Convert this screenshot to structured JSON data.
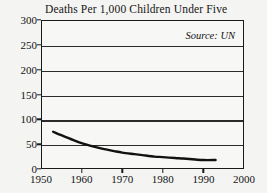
{
  "chart_data": {
    "type": "line",
    "title": "Deaths Per 1,000 Children Under Five",
    "xlabel": "",
    "ylabel": "",
    "annotation": "Source: UN",
    "grid": true,
    "legend": "none",
    "xlim": [
      1950,
      2000
    ],
    "ylim": [
      0,
      300
    ],
    "xticks": [
      1950,
      1960,
      1970,
      1980,
      1990,
      2000
    ],
    "xtick_labels": [
      "1950",
      "1960",
      "1970",
      "1980",
      "1990",
      "2000"
    ],
    "yticks": [
      0,
      50,
      100,
      150,
      200,
      250,
      300
    ],
    "ytick_labels": [
      "0",
      "50",
      "100",
      "150",
      "200",
      "250",
      "300"
    ],
    "series": [
      {
        "name": "Deaths per 1,000 children under five",
        "color": "#111111",
        "x": [
          1953,
          1955,
          1958,
          1960,
          1963,
          1965,
          1968,
          1970,
          1973,
          1975,
          1978,
          1980,
          1983,
          1985,
          1988,
          1990,
          1993
        ],
        "values": [
          75,
          68,
          58,
          52,
          45,
          41,
          36,
          33,
          30,
          28,
          25,
          24,
          22,
          21,
          19,
          18,
          18
        ]
      }
    ]
  },
  "labels": {
    "title": "Deaths Per 1,000 Children Under Five",
    "source": "Source: UN"
  },
  "colors": {
    "line": "#111111",
    "grid": "#2b2b2b",
    "frame": "#1a1a1a",
    "background": "#f4f4f2",
    "plot_background": "#f7f7f5",
    "text": "#131313"
  }
}
